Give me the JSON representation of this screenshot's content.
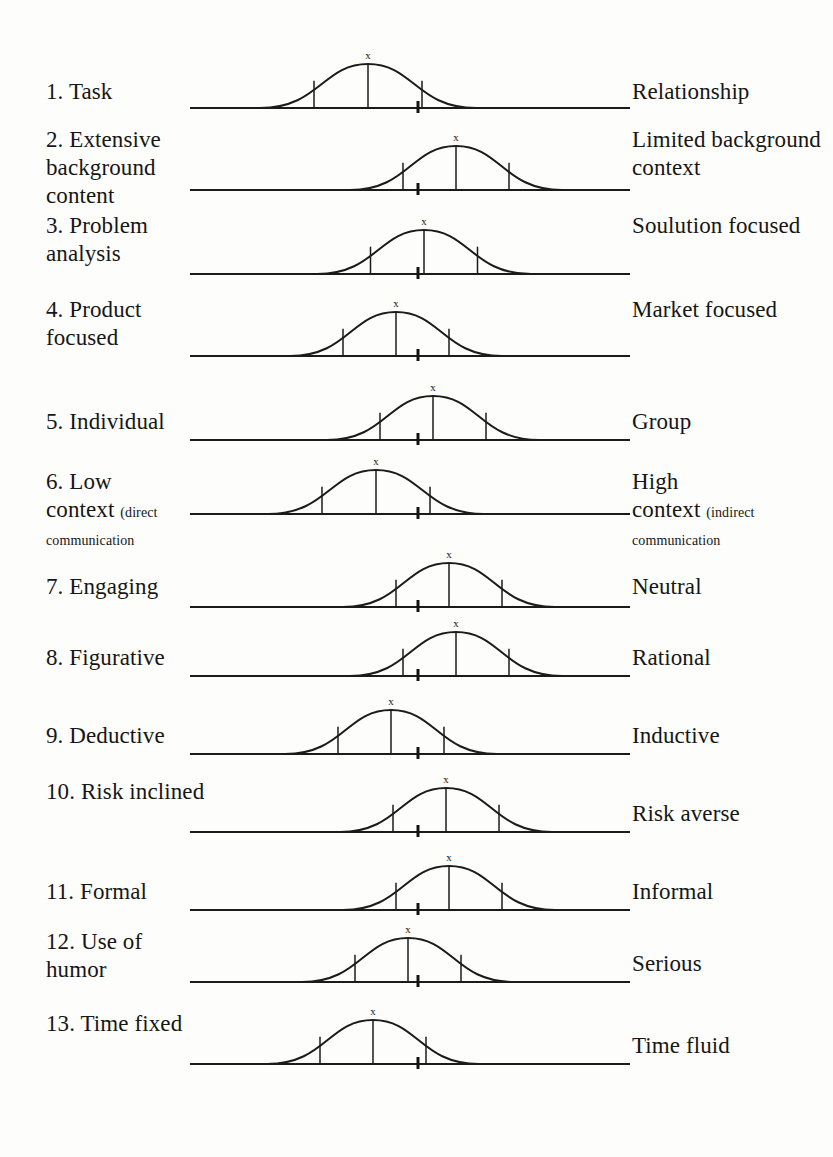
{
  "document": {
    "type": "communication-style-continuum-worksheet",
    "total_rows": 13,
    "marker_glyph": "x",
    "ink_color": "#1b1b1b",
    "background_color": "#fdfdfb"
  },
  "rows": [
    {
      "number": "1.",
      "left_label": "Task",
      "left_sub": "",
      "right_label": "Relationship",
      "right_sub": "",
      "y": 46,
      "label_left_y": 78,
      "label_right_y": 78,
      "curve_left": 70,
      "curve_peak": 178,
      "curve_right": 286,
      "tick": 228
    },
    {
      "number": "2.",
      "left_label": "Extensive background content",
      "left_sub": "",
      "right_label": "Limited background context",
      "right_sub": "",
      "y": 128,
      "label_left_y": 126,
      "label_right_y": 126,
      "curve_left": 160,
      "curve_peak": 266,
      "curve_right": 372,
      "tick": 228
    },
    {
      "number": "3.",
      "left_label": "Problem analysis",
      "left_sub": "",
      "right_label": "Soulution focused",
      "right_sub": "",
      "y": 212,
      "label_left_y": 212,
      "label_right_y": 212,
      "curve_left": 127,
      "curve_peak": 234,
      "curve_right": 341,
      "tick": 228
    },
    {
      "number": "4.",
      "left_label": "Product focused",
      "left_sub": "",
      "right_label": "Market focused",
      "right_sub": "",
      "y": 294,
      "label_left_y": 296,
      "label_right_y": 296,
      "curve_left": 100,
      "curve_peak": 206,
      "curve_right": 312,
      "tick": 228
    },
    {
      "number": "5.",
      "left_label": "Individual",
      "left_sub": "",
      "right_label": "Group",
      "right_sub": "",
      "y": 378,
      "label_left_y": 408,
      "label_right_y": 408,
      "curve_left": 137,
      "curve_peak": 243,
      "curve_right": 349,
      "tick": 228
    },
    {
      "number": "6.",
      "left_label": "Low",
      "left_sub_bold": "context",
      "left_sub": "(direct",
      "left_sub2": "communication",
      "right_label": "High",
      "right_sub_bold": "context",
      "right_sub": "(indirect",
      "right_sub2": "communication",
      "y": 452,
      "label_left_y": 468,
      "label_right_y": 468,
      "curve_left": 78,
      "curve_peak": 186,
      "curve_right": 294,
      "tick": 228
    },
    {
      "number": "7.",
      "left_label": "Engaging",
      "left_sub": "",
      "right_label": "Neutral",
      "right_sub": "",
      "y": 545,
      "label_left_y": 573,
      "label_right_y": 573,
      "curve_left": 153,
      "curve_peak": 259,
      "curve_right": 365,
      "tick": 228
    },
    {
      "number": "8.",
      "left_label": "Figurative",
      "left_sub": "",
      "right_label": "Rational",
      "right_sub": "",
      "y": 614,
      "label_left_y": 644,
      "label_right_y": 644,
      "curve_left": 160,
      "curve_peak": 266,
      "curve_right": 372,
      "tick": 228
    },
    {
      "number": "9.",
      "left_label": "Deductive",
      "left_sub": "",
      "right_label": "Inductive",
      "right_sub": "",
      "y": 692,
      "label_left_y": 722,
      "label_right_y": 722,
      "curve_left": 95,
      "curve_peak": 201,
      "curve_right": 307,
      "tick": 228
    },
    {
      "number": "10.",
      "left_label": "Risk inclined",
      "left_sub": "",
      "right_label": "Risk averse",
      "right_sub": "",
      "y": 770,
      "label_left_y": 778,
      "label_right_y": 800,
      "curve_left": 150,
      "curve_peak": 256,
      "curve_right": 362,
      "tick": 228
    },
    {
      "number": "11.",
      "left_label": "Formal",
      "left_sub": "",
      "right_label": "Informal",
      "right_sub": "",
      "y": 848,
      "label_left_y": 878,
      "label_right_y": 878,
      "curve_left": 153,
      "curve_peak": 259,
      "curve_right": 365,
      "tick": 228
    },
    {
      "number": "12.",
      "left_label": "Use of humor",
      "left_sub": "",
      "right_label": "Serious",
      "right_sub": "",
      "y": 920,
      "label_left_y": 928,
      "label_right_y": 950,
      "curve_left": 112,
      "curve_peak": 218,
      "curve_right": 324,
      "tick": 228
    },
    {
      "number": "13.",
      "left_label": "Time fixed",
      "left_sub": "",
      "right_label": "Time fluid",
      "right_sub": "",
      "y": 1002,
      "label_left_y": 1010,
      "label_right_y": 1032,
      "curve_left": 77,
      "curve_peak": 183,
      "curve_right": 289,
      "tick": 228
    }
  ],
  "chart_data": {
    "type": "line",
    "xlabel": "",
    "ylabel": "",
    "categories": [
      "1. Task — Relationship",
      "2. Extensive background content — Limited background context",
      "3. Problem analysis — Soulution focused",
      "4. Product focused — Market focused",
      "5. Individual — Group",
      "6. Low context (direct communication — High context (indirect communication",
      "7. Engaging — Neutral",
      "8. Figurative — Rational",
      "9. Deductive — Inductive",
      "10. Risk inclined — Risk averse",
      "11. Formal — Informal",
      "12. Use of humor — Serious",
      "13. Time fixed — Time fluid"
    ],
    "series": [
      {
        "name": "curve apex position (0 = far left pole, 100 = far right pole)",
        "values": [
          40,
          60,
          53,
          47,
          55,
          42,
          59,
          60,
          46,
          58,
          59,
          50,
          42
        ]
      },
      {
        "name": "baseline midpoint tick position",
        "values": [
          52,
          52,
          52,
          52,
          52,
          52,
          52,
          52,
          52,
          52,
          52,
          52,
          52
        ]
      }
    ],
    "legend": [],
    "grid": false
  }
}
